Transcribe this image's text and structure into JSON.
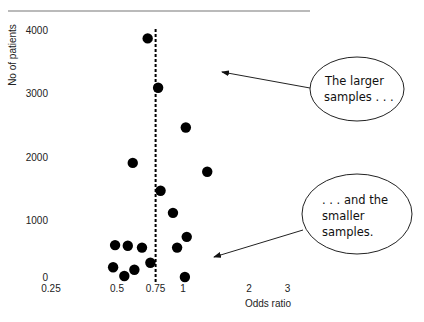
{
  "chart_data": {
    "type": "scatter",
    "title": "",
    "xlabel": "Odds ratio",
    "ylabel": "No of patients",
    "xscale": "log",
    "x_ticks": [
      0.25,
      0.5,
      0.75,
      1,
      2,
      3
    ],
    "x_tick_labels": [
      "0.25",
      "0.5",
      "0.75",
      "1",
      "2",
      "3"
    ],
    "y_ticks": [
      0,
      1000,
      2000,
      3000,
      4000
    ],
    "y_tick_labels": [
      "0",
      "1000",
      "2000",
      "3000",
      "4000"
    ],
    "ylim": [
      0,
      4000
    ],
    "xlim": [
      0.25,
      3
    ],
    "grid": false,
    "reference_line": {
      "x": 0.75,
      "style": "dashed"
    },
    "series": [
      {
        "name": "studies",
        "points": [
          {
            "x": 0.69,
            "y": 3870
          },
          {
            "x": 0.77,
            "y": 3090
          },
          {
            "x": 1.03,
            "y": 2460
          },
          {
            "x": 0.59,
            "y": 1900
          },
          {
            "x": 1.29,
            "y": 1760
          },
          {
            "x": 0.79,
            "y": 1460
          },
          {
            "x": 0.9,
            "y": 1110
          },
          {
            "x": 1.04,
            "y": 730
          },
          {
            "x": 0.49,
            "y": 600
          },
          {
            "x": 0.56,
            "y": 590
          },
          {
            "x": 0.65,
            "y": 560
          },
          {
            "x": 0.94,
            "y": 560
          },
          {
            "x": 0.71,
            "y": 320
          },
          {
            "x": 0.48,
            "y": 250
          },
          {
            "x": 0.6,
            "y": 210
          },
          {
            "x": 0.54,
            "y": 110
          },
          {
            "x": 1.02,
            "y": 95
          }
        ]
      }
    ],
    "annotations": [
      {
        "lines": [
          "The larger",
          "samples . . ."
        ],
        "points_to": "upper region"
      },
      {
        "lines": [
          ". . . and the",
          "smaller",
          "samples."
        ],
        "points_to": "lower region"
      }
    ]
  },
  "colors": {
    "points": "#000000",
    "line": "#000000",
    "background": "#ffffff"
  }
}
